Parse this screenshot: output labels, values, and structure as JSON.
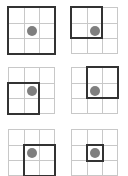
{
  "diagram": {
    "grid_size": 3,
    "colors": {
      "grid_line": "#c8c8c8",
      "window_border": "#333333",
      "dot": "#7f7f7f",
      "background": "#ffffff"
    },
    "panels": [
      {
        "id": "panel-1",
        "x": 8,
        "y": 7,
        "window": {
          "col": 0,
          "row": 0,
          "cols": 3,
          "rows": 3
        },
        "dot": {
          "col": 1,
          "row": 1
        }
      },
      {
        "id": "panel-2",
        "x": 71,
        "y": 7,
        "window": {
          "col": 0,
          "row": 0,
          "cols": 2,
          "rows": 2
        },
        "dot": {
          "col": 1,
          "row": 1
        }
      },
      {
        "id": "panel-3",
        "x": 8,
        "y": 67,
        "window": {
          "col": 0,
          "row": 1,
          "cols": 2,
          "rows": 2
        },
        "dot": {
          "col": 1,
          "row": 1
        }
      },
      {
        "id": "panel-4",
        "x": 71,
        "y": 67,
        "window": {
          "col": 1,
          "row": 0,
          "cols": 2,
          "rows": 2
        },
        "dot": {
          "col": 1,
          "row": 1
        }
      },
      {
        "id": "panel-5",
        "x": 8,
        "y": 129,
        "window": {
          "col": 1,
          "row": 1,
          "cols": 2,
          "rows": 2
        },
        "dot": {
          "col": 1,
          "row": 1
        }
      },
      {
        "id": "panel-6",
        "x": 71,
        "y": 129,
        "window": {
          "col": 1,
          "row": 1,
          "cols": 1,
          "rows": 1
        },
        "dot": {
          "col": 1,
          "row": 1
        }
      }
    ]
  }
}
